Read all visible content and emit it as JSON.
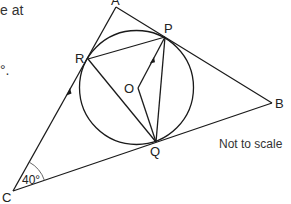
{
  "text_fragments": {
    "top": "e at",
    "mid": "°."
  },
  "points": {
    "A": {
      "label": "A",
      "x": 116,
      "y": 7
    },
    "P": {
      "label": "P",
      "x": 165,
      "y": 37
    },
    "R": {
      "label": "R",
      "x": 88,
      "y": 59
    },
    "O": {
      "label": "O",
      "x": 138,
      "y": 88
    },
    "Q": {
      "label": "Q",
      "x": 156,
      "y": 142
    },
    "B": {
      "label": "B",
      "x": 272,
      "y": 103
    },
    "C": {
      "label": "C",
      "x": 13,
      "y": 191
    }
  },
  "circle": {
    "cx": 136.5,
    "cy": 87.5,
    "r": 57
  },
  "angle_C": "40°",
  "note": "Not to scale",
  "colors": {
    "stroke": "#1a1a1a",
    "text": "#222222",
    "background": "#ffffff"
  }
}
